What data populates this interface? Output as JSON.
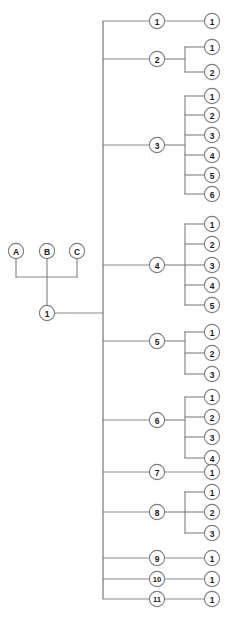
{
  "diagram": {
    "type": "tree",
    "background_color": "#ffffff",
    "line_color": "#8a8a8a",
    "node_fill_color": "#ffffff",
    "node_stroke_color": "#7d7d7d",
    "text_color": "#1a1a1a",
    "node_radius": 7.6,
    "levels": 4,
    "columns": {
      "roots_x": [
        16,
        47,
        77
      ],
      "root_join_x": 47,
      "trunk_x": 103,
      "branch_x": 157,
      "bracket_x": 185,
      "leaf_x": 212
    },
    "roots": [
      {
        "id": "root-a",
        "label": "A",
        "x": 16,
        "y": 251
      },
      {
        "id": "root-b",
        "label": "B",
        "x": 47,
        "y": 251
      },
      {
        "id": "root-c",
        "label": "C",
        "x": 77,
        "y": 251
      }
    ],
    "root_merge_y": 277,
    "stem": {
      "id": "stem-1",
      "label": "1",
      "x": 47,
      "y": 313
    },
    "trunk": {
      "x": 103,
      "y_top": 21,
      "y_bottom": 599
    },
    "branches": [
      {
        "id": "branch-1",
        "label": "1",
        "x": 157,
        "y": 21,
        "bracket": false,
        "leaves": [
          {
            "label": "1",
            "x": 212,
            "y": 21
          }
        ]
      },
      {
        "id": "branch-2",
        "label": "2",
        "x": 157,
        "y": 59,
        "bracket": true,
        "leaves": [
          {
            "label": "1",
            "x": 212,
            "y": 47
          },
          {
            "label": "2",
            "x": 212,
            "y": 72
          }
        ]
      },
      {
        "id": "branch-3",
        "label": "3",
        "x": 157,
        "y": 145,
        "bracket": true,
        "leaves": [
          {
            "label": "1",
            "x": 212,
            "y": 96
          },
          {
            "label": "2",
            "x": 212,
            "y": 115
          },
          {
            "label": "3",
            "x": 212,
            "y": 135
          },
          {
            "label": "4",
            "x": 212,
            "y": 155
          },
          {
            "label": "5",
            "x": 212,
            "y": 175
          },
          {
            "label": "6",
            "x": 212,
            "y": 194
          }
        ]
      },
      {
        "id": "branch-4",
        "label": "4",
        "x": 157,
        "y": 265,
        "bracket": true,
        "leaves": [
          {
            "label": "1",
            "x": 212,
            "y": 224
          },
          {
            "label": "2",
            "x": 212,
            "y": 244
          },
          {
            "label": "3",
            "x": 212,
            "y": 265
          },
          {
            "label": "4",
            "x": 212,
            "y": 285
          },
          {
            "label": "5",
            "x": 212,
            "y": 305
          }
        ]
      },
      {
        "id": "branch-5",
        "label": "5",
        "x": 157,
        "y": 341,
        "bracket": true,
        "leaves": [
          {
            "label": "1",
            "x": 212,
            "y": 332
          },
          {
            "label": "2",
            "x": 212,
            "y": 353
          },
          {
            "label": "3",
            "x": 212,
            "y": 374
          }
        ]
      },
      {
        "id": "branch-6",
        "label": "6",
        "x": 157,
        "y": 420,
        "bracket": true,
        "leaves": [
          {
            "label": "1",
            "x": 212,
            "y": 397
          },
          {
            "label": "2",
            "x": 212,
            "y": 417
          },
          {
            "label": "3",
            "x": 212,
            "y": 437
          },
          {
            "label": "4",
            "x": 212,
            "y": 458
          }
        ]
      },
      {
        "id": "branch-7",
        "label": "7",
        "x": 157,
        "y": 472,
        "bracket": false,
        "leaves": [
          {
            "label": "1",
            "x": 212,
            "y": 472
          }
        ]
      },
      {
        "id": "branch-8",
        "label": "8",
        "x": 157,
        "y": 512,
        "bracket": true,
        "leaves": [
          {
            "label": "1",
            "x": 212,
            "y": 492
          },
          {
            "label": "2",
            "x": 212,
            "y": 512
          },
          {
            "label": "3",
            "x": 212,
            "y": 533
          }
        ]
      },
      {
        "id": "branch-9",
        "label": "9",
        "x": 157,
        "y": 558,
        "bracket": false,
        "leaves": [
          {
            "label": "1",
            "x": 212,
            "y": 558
          }
        ]
      },
      {
        "id": "branch-10",
        "label": "10",
        "x": 157,
        "y": 579,
        "bracket": false,
        "leaves": [
          {
            "label": "1",
            "x": 212,
            "y": 579
          }
        ]
      },
      {
        "id": "branch-11",
        "label": "11",
        "x": 157,
        "y": 599,
        "bracket": false,
        "leaves": [
          {
            "label": "1",
            "x": 212,
            "y": 599
          }
        ]
      }
    ]
  }
}
